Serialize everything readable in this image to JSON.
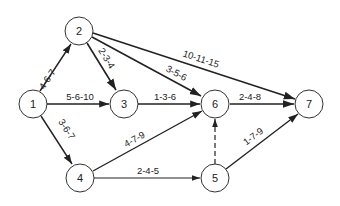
{
  "diagram": {
    "type": "pert-network",
    "nodes": [
      {
        "id": "1",
        "label": "1",
        "x": 33,
        "y": 104
      },
      {
        "id": "2",
        "label": "2",
        "x": 79,
        "y": 31
      },
      {
        "id": "3",
        "label": "3",
        "x": 124,
        "y": 104
      },
      {
        "id": "4",
        "label": "4",
        "x": 80,
        "y": 178
      },
      {
        "id": "5",
        "label": "5",
        "x": 215,
        "y": 178
      },
      {
        "id": "6",
        "label": "6",
        "x": 215,
        "y": 104
      },
      {
        "id": "7",
        "label": "7",
        "x": 309,
        "y": 104
      }
    ],
    "edges": [
      {
        "from": "1",
        "to": "2",
        "label": "4-6-7",
        "dashed": false
      },
      {
        "from": "1",
        "to": "3",
        "label": "5-6-10",
        "dashed": false
      },
      {
        "from": "1",
        "to": "4",
        "label": "3-6-7",
        "dashed": false
      },
      {
        "from": "2",
        "to": "3",
        "label": "2-3-4",
        "dashed": false
      },
      {
        "from": "2",
        "to": "6",
        "label": "3-5-6",
        "dashed": false
      },
      {
        "from": "2",
        "to": "7",
        "label": "10-11-15",
        "dashed": false
      },
      {
        "from": "3",
        "to": "6",
        "label": "1-3-6",
        "dashed": false
      },
      {
        "from": "4",
        "to": "6",
        "label": "4-7-9",
        "dashed": false
      },
      {
        "from": "4",
        "to": "5",
        "label": "2-4-5",
        "dashed": false
      },
      {
        "from": "5",
        "to": "6",
        "label": "",
        "dashed": true
      },
      {
        "from": "5",
        "to": "7",
        "label": "1-7-9",
        "dashed": false
      },
      {
        "from": "6",
        "to": "7",
        "label": "2-4-8",
        "dashed": false
      }
    ]
  }
}
